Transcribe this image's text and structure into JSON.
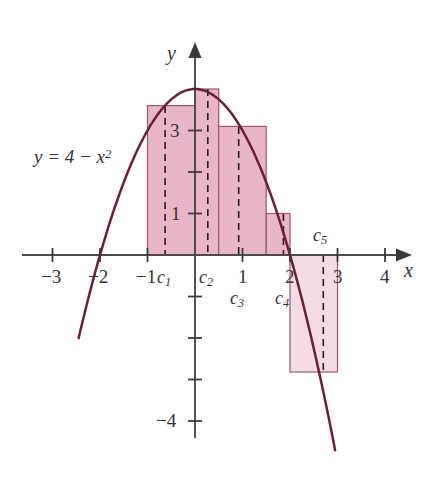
{
  "figure": {
    "kind": "riemann-sum-diagram",
    "curve_label": "y = 4 − x²",
    "axis_x_label": "x",
    "axis_y_label": "y"
  },
  "colors": {
    "curve": "#6b1f33",
    "bar_fill": "#e9b6c9",
    "bar_fill_negative": "#f4dce6",
    "bar_stroke": "#9c5570",
    "axis": "#4a4a4a",
    "dashed": "#231f20",
    "text": "#353035",
    "background": "#ffffff"
  },
  "chart_data": {
    "type": "bar",
    "title": "",
    "xlabel": "x",
    "ylabel": "y",
    "function": "y = 4 - x^2",
    "xlim": [
      -3.6,
      4.6
    ],
    "ylim": [
      -5.4,
      4.9
    ],
    "grid": false,
    "legend": "none",
    "x_ticks": [
      -3,
      -2,
      -1,
      1,
      2,
      3,
      4
    ],
    "x_tick_labels": [
      "−3",
      "−2",
      "−1",
      "1",
      "2",
      "3",
      "4"
    ],
    "y_ticks": [
      3,
      2,
      1,
      -1,
      -2,
      -3,
      -4
    ],
    "y_tick_labels_shown": [
      "3",
      "1",
      "−4"
    ],
    "curve_x_range": [
      -2.45,
      2.95
    ],
    "rectangles": [
      {
        "name": "c₁",
        "x_left": -1.0,
        "x_right": 0.0,
        "height": 3.6,
        "c": -0.63,
        "c_label": "c₁",
        "label_position": "below-axis"
      },
      {
        "name": "c₂",
        "x_left": 0.0,
        "x_right": 0.5,
        "height": 4.0,
        "c": 0.27,
        "c_label": "c₂",
        "label_position": "below-axis"
      },
      {
        "name": "c₃",
        "x_left": 0.5,
        "x_right": 1.5,
        "height": 3.1,
        "c": 0.92,
        "c_label": "c₃",
        "label_position": "below-axis-2"
      },
      {
        "name": "c₄",
        "x_left": 1.5,
        "x_right": 2.0,
        "height": 1.0,
        "c": 1.86,
        "c_label": "c₄",
        "label_position": "below-axis-2"
      },
      {
        "name": "c₅",
        "x_left": 2.0,
        "x_right": 3.0,
        "height": -2.82,
        "c": 2.7,
        "c_label": "c₅",
        "label_position": "above-axis"
      }
    ]
  },
  "labels": {
    "equation": "y = 4 − x",
    "equation_exponent": "2",
    "equation_var": "y",
    "x_minus3": "−3",
    "x_minus2": "−2",
    "x_minus1": "−1",
    "x_1": "1",
    "x_2": "2",
    "x_3": "3",
    "x_4": "4",
    "y_3": "3",
    "y_1": "1",
    "y_minus4": "−4",
    "axis_x": "x",
    "axis_y": "y",
    "c1": "c",
    "c1_sub": "1",
    "c2": "c",
    "c2_sub": "2",
    "c3": "c",
    "c3_sub": "3",
    "c4": "c",
    "c4_sub": "4",
    "c5": "c",
    "c5_sub": "5"
  }
}
